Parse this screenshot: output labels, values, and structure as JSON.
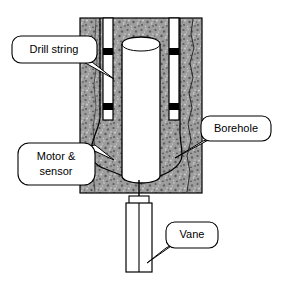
{
  "figure": {
    "background_color": "#ffffff"
  },
  "colors": {
    "rock_fill": "#9d9d9d",
    "rock_speckle_dark": "#555555",
    "rock_speckle_light": "#d8d8d8",
    "component_fill": "#ffffff",
    "outline": "#000000",
    "stabilizer_band": "#000000",
    "callout_fill": "#ffffff"
  },
  "components": [
    {
      "name": "rock-formation",
      "label": "rock formation block",
      "fill": "#9d9d9d",
      "x": 80,
      "y": 18,
      "width": 122,
      "height": 175
    },
    {
      "name": "drill-pipe-left",
      "label": "left drill pipe",
      "fill": "#ffffff",
      "x": 103,
      "y": 18,
      "width": 10,
      "height": 102
    },
    {
      "name": "drill-pipe-right",
      "label": "right drill pipe",
      "fill": "#ffffff",
      "x": 169,
      "y": 18,
      "width": 10,
      "height": 102
    },
    {
      "name": "motor-sensor-housing",
      "label": "central motor and sensor tube",
      "fill": "#ffffff",
      "x": 122,
      "y": 38,
      "width": 38,
      "height": 144
    },
    {
      "name": "vane",
      "label": "vane body",
      "fill": "#ffffff",
      "x": 126,
      "y": 203,
      "width": 26,
      "height": 69
    },
    {
      "name": "vane-collar",
      "label": "vane top collar",
      "fill": "#ffffff",
      "x": 129,
      "y": 197,
      "width": 20,
      "height": 7
    },
    {
      "name": "drive-shaft",
      "label": "drive shaft line",
      "x1": 139,
      "y1": 182,
      "x2": 139,
      "y2": 272
    }
  ],
  "stabilizers": [
    {
      "name": "stabilizer-upper-left",
      "x": 103,
      "y": 48,
      "width": 10,
      "height": 7
    },
    {
      "name": "stabilizer-upper-right",
      "x": 169,
      "y": 48,
      "width": 10,
      "height": 7
    },
    {
      "name": "stabilizer-lower-left",
      "x": 103,
      "y": 103,
      "width": 10,
      "height": 7
    },
    {
      "name": "stabilizer-lower-right",
      "x": 169,
      "y": 103,
      "width": 10,
      "height": 7
    }
  ],
  "callouts": [
    {
      "id": "drill-string",
      "label": "Drill string",
      "lines": [
        "Drill string"
      ],
      "box": {
        "x": 12,
        "y": 36,
        "width": 85,
        "height": 27,
        "radius": 9
      },
      "text_anchor": {
        "x": 54,
        "y": 50
      },
      "tail": [
        [
          80,
          60
        ],
        [
          92,
          62
        ],
        [
          114,
          79
        ]
      ]
    },
    {
      "id": "borehole",
      "label": "Borehole",
      "lines": [
        "Borehole"
      ],
      "box": {
        "x": 201,
        "y": 116,
        "width": 70,
        "height": 25,
        "radius": 9
      },
      "text_anchor": {
        "x": 236,
        "y": 129
      },
      "tail": [
        [
          212,
          138
        ],
        [
          203,
          140
        ],
        [
          175,
          158
        ]
      ]
    },
    {
      "id": "motor-sensor",
      "label": "Motor & sensor",
      "lines": [
        "Motor &",
        "sensor"
      ],
      "box": {
        "x": 18,
        "y": 143,
        "width": 77,
        "height": 42,
        "radius": 11
      },
      "text_anchor": {
        "x": 56,
        "y": 156
      },
      "text_anchor_line2": {
        "x": 56,
        "y": 172
      },
      "tail": [
        [
          86,
          148
        ],
        [
          96,
          146
        ],
        [
          113,
          160
        ]
      ]
    },
    {
      "id": "vane",
      "label": "Vane",
      "lines": [
        "Vane"
      ],
      "box": {
        "x": 166,
        "y": 222,
        "width": 52,
        "height": 26,
        "radius": 9
      },
      "text_anchor": {
        "x": 192,
        "y": 235
      },
      "tail": [
        [
          173,
          245
        ],
        [
          166,
          247
        ],
        [
          147,
          263
        ]
      ]
    }
  ]
}
